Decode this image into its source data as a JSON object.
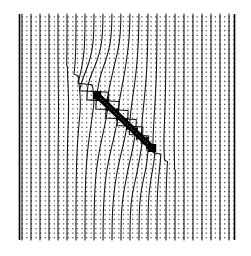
{
  "figure": {
    "title": "Streamline deflection around an inclined barrier",
    "background_color": "#ffffff",
    "ink_color": "#000000",
    "mesh_dot_color": "#4a4a4a",
    "streamline_color": "#111111"
  },
  "chart_data": {
    "type": "line",
    "title": "Streamline deflection around an inclined barrier",
    "subtitle": "",
    "xlabel": "",
    "ylabel": "",
    "xlim": [
      0,
      100
    ],
    "ylim": [
      0,
      100
    ],
    "grid": true,
    "grid_style": "dotted-mesh",
    "legend": "none",
    "annotations": [],
    "tick_labels_x": [],
    "tick_labels_y": [],
    "domain": {
      "left_px": 19.5,
      "right_px": 234.5,
      "top_px": 14.0,
      "bottom_px": 240.0,
      "border_edges": [
        "left",
        "right"
      ]
    },
    "mesh": {
      "dot_spacing_x_px": 4.6,
      "dot_spacing_y_px": 4.6,
      "dot_radius_px": 0.62,
      "columns": 47,
      "rows": 50
    },
    "barrier": {
      "name": "inclusion",
      "shape": "inclined-serrated-bar",
      "start_px": [
        97.0,
        95.0
      ],
      "end_px": [
        152.0,
        148.0
      ],
      "thickness_px": 6.2,
      "angle_deg": 43.9,
      "teeth_count": 11,
      "color": "#000000"
    },
    "series": [
      {
        "name": "streamline-01",
        "x0": 22.0,
        "deflection": 0.0
      },
      {
        "name": "streamline-02",
        "x0": 31.0,
        "deflection": 0.0
      },
      {
        "name": "streamline-03",
        "x0": 40.0,
        "deflection": 0.02
      },
      {
        "name": "streamline-04",
        "x0": 49.0,
        "deflection": 0.05
      },
      {
        "name": "streamline-05",
        "x0": 58.0,
        "deflection": 0.1
      },
      {
        "name": "streamline-06",
        "x0": 67.0,
        "deflection": 0.2
      },
      {
        "name": "streamline-07",
        "x0": 76.0,
        "deflection": 0.38
      },
      {
        "name": "streamline-08",
        "x0": 85.0,
        "deflection": 0.62
      },
      {
        "name": "streamline-09",
        "x0": 94.0,
        "deflection": 0.92
      },
      {
        "name": "streamline-10",
        "x0": 103.0,
        "deflection": 1.0
      },
      {
        "name": "streamline-11",
        "x0": 112.0,
        "deflection": 1.0
      },
      {
        "name": "streamline-12",
        "x0": 121.0,
        "deflection": 0.95
      },
      {
        "name": "streamline-13",
        "x0": 130.0,
        "deflection": 0.8
      },
      {
        "name": "streamline-14",
        "x0": 139.0,
        "deflection": 0.6
      },
      {
        "name": "streamline-15",
        "x0": 148.0,
        "deflection": 0.42
      },
      {
        "name": "streamline-16",
        "x0": 157.0,
        "deflection": 0.26
      },
      {
        "name": "streamline-17",
        "x0": 166.0,
        "deflection": 0.15
      },
      {
        "name": "streamline-18",
        "x0": 175.0,
        "deflection": 0.08
      },
      {
        "name": "streamline-19",
        "x0": 184.0,
        "deflection": 0.04
      },
      {
        "name": "streamline-20",
        "x0": 193.0,
        "deflection": 0.02
      },
      {
        "name": "streamline-21",
        "x0": 202.0,
        "deflection": 0.01
      },
      {
        "name": "streamline-22",
        "x0": 211.0,
        "deflection": 0.0
      },
      {
        "name": "streamline-23",
        "x0": 220.0,
        "deflection": 0.0
      },
      {
        "name": "streamline-24",
        "x0": 229.0,
        "deflection": 0.0
      }
    ]
  }
}
